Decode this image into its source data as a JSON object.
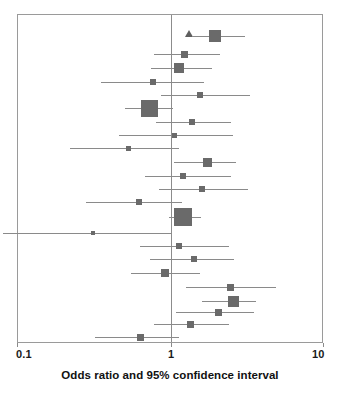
{
  "figure": {
    "type": "forest-plot",
    "axis_title": "Odds ratio and 95% confidence interval",
    "marker_color": "#6a6a6a",
    "line_color": "#8a8a8a",
    "frame_color": "#9a9a9a",
    "null_line_label": "1"
  },
  "axis": {
    "scale": "log10",
    "ticks": [
      {
        "value": 0.1,
        "label": "0.1",
        "x": 17
      },
      {
        "value": 1,
        "label": "1",
        "x": 171
      },
      {
        "value": 10,
        "label": "10",
        "x": 323
      }
    ],
    "min": 0.1,
    "max": 10
  },
  "chart_data": {
    "type": "forest",
    "title": "",
    "subtitle": "",
    "xlabel": "Odds ratio and 95% confidence interval",
    "ylabel": "",
    "xscale": "log",
    "xlim": [
      0.1,
      10
    ],
    "xticks": [
      0.1,
      1,
      10
    ],
    "xticklabels": [
      "0.1",
      "1",
      "10"
    ],
    "grid": false,
    "legend": "none",
    "reference_line": 1,
    "categories": [
      "Study 1",
      "Study 2",
      "Study 3",
      "Study 4",
      "Study 5",
      "Study 6",
      "Study 7",
      "Study 8",
      "Study 9",
      "Study 10",
      "Study 11",
      "Study 12",
      "Study 13",
      "Study 14",
      "Study 15",
      "Study 16",
      "Study 17",
      "Study 18",
      "Study 19"
    ],
    "studies": [
      {
        "label": "Study 1",
        "odds_ratio": 1.95,
        "ci_low": 1.4,
        "ci_high": 3.05,
        "weight": 0.78
      },
      {
        "label": "Study 2",
        "odds_ratio": 1.22,
        "ci_low": 0.78,
        "ci_high": 2.1,
        "weight": 0.4
      },
      {
        "label": "Study 3",
        "odds_ratio": 1.13,
        "ci_low": 0.74,
        "ci_high": 1.85,
        "weight": 0.62
      },
      {
        "label": "Study 4",
        "odds_ratio": 0.76,
        "ci_low": 0.35,
        "ci_high": 1.65,
        "weight": 0.33
      },
      {
        "label": "Study 5",
        "odds_ratio": 1.55,
        "ci_low": 0.86,
        "ci_high": 3.3,
        "weight": 0.33
      },
      {
        "label": "Study 6",
        "odds_ratio": 0.72,
        "ci_low": 0.5,
        "ci_high": 1.03,
        "weight": 1.0
      },
      {
        "label": "Study 7",
        "odds_ratio": 1.38,
        "ci_low": 0.8,
        "ci_high": 2.45,
        "weight": 0.33
      },
      {
        "label": "Study 8",
        "odds_ratio": 1.05,
        "ci_low": 0.46,
        "ci_high": 2.55,
        "weight": 0.26
      },
      {
        "label": "Study 9",
        "odds_ratio": 0.53,
        "ci_low": 0.22,
        "ci_high": 1.12,
        "weight": 0.26
      },
      {
        "label": "Study 10",
        "odds_ratio": 1.72,
        "ci_low": 1.05,
        "ci_high": 2.65,
        "weight": 0.58
      },
      {
        "label": "Study 11",
        "odds_ratio": 1.2,
        "ci_low": 0.68,
        "ci_high": 2.45,
        "weight": 0.33
      },
      {
        "label": "Study 12",
        "odds_ratio": 1.6,
        "ci_low": 0.84,
        "ci_high": 3.2,
        "weight": 0.33
      },
      {
        "label": "Study 13",
        "odds_ratio": 0.62,
        "ci_low": 0.28,
        "ci_high": 1.18,
        "weight": 0.33
      },
      {
        "label": "Study 14",
        "odds_ratio": 1.2,
        "ci_low": 0.97,
        "ci_high": 1.58,
        "weight": 1.05
      },
      {
        "label": "Study 15",
        "odds_ratio": 0.31,
        "ci_low": 0.08,
        "ci_high": 1.0,
        "weight": 0.2
      },
      {
        "label": "Study 16",
        "odds_ratio": 1.13,
        "ci_low": 0.63,
        "ci_high": 2.4,
        "weight": 0.33
      },
      {
        "label": "Study 17",
        "odds_ratio": 1.42,
        "ci_low": 0.73,
        "ci_high": 2.6,
        "weight": 0.33
      },
      {
        "label": "Study 18",
        "odds_ratio": 0.92,
        "ci_low": 0.55,
        "ci_high": 1.55,
        "weight": 0.46
      },
      {
        "label": "Study 19",
        "odds_ratio": 2.45,
        "ci_low": 1.25,
        "ci_high": 4.85,
        "weight": 0.4
      },
      {
        "label": "Study 20",
        "odds_ratio": 2.55,
        "ci_low": 1.6,
        "ci_high": 3.6,
        "weight": 0.72
      },
      {
        "label": "Study 21",
        "odds_ratio": 2.05,
        "ci_low": 1.08,
        "ci_high": 3.5,
        "weight": 0.4
      },
      {
        "label": "Study 22",
        "odds_ratio": 1.35,
        "ci_low": 0.78,
        "ci_high": 2.4,
        "weight": 0.4
      },
      {
        "label": "Study 23",
        "odds_ratio": 0.63,
        "ci_low": 0.32,
        "ci_high": 1.12,
        "weight": 0.4
      }
    ],
    "rows_layout": [
      {
        "y": 35,
        "or": 1.95,
        "lo": 1.4,
        "hi": 3.05,
        "size": 12
      },
      {
        "y": 53,
        "or": 1.22,
        "lo": 0.78,
        "hi": 2.1,
        "size": 7
      },
      {
        "y": 67,
        "or": 1.13,
        "lo": 0.74,
        "hi": 1.85,
        "size": 10
      },
      {
        "y": 81,
        "or": 0.76,
        "lo": 0.35,
        "hi": 1.65,
        "size": 6
      },
      {
        "y": 94,
        "or": 1.55,
        "lo": 0.86,
        "hi": 3.3,
        "size": 6
      },
      {
        "y": 107,
        "or": 0.72,
        "lo": 0.5,
        "hi": 1.03,
        "size": 17
      },
      {
        "y": 121,
        "or": 1.38,
        "lo": 0.8,
        "hi": 2.45,
        "size": 6
      },
      {
        "y": 134,
        "or": 1.05,
        "lo": 0.46,
        "hi": 2.55,
        "size": 5
      },
      {
        "y": 147,
        "or": 0.53,
        "lo": 0.22,
        "hi": 1.12,
        "size": 5
      },
      {
        "y": 161,
        "or": 1.72,
        "lo": 1.05,
        "hi": 2.65,
        "size": 9
      },
      {
        "y": 175,
        "or": 1.2,
        "lo": 0.68,
        "hi": 2.45,
        "size": 6
      },
      {
        "y": 188,
        "or": 1.6,
        "lo": 0.84,
        "hi": 3.2,
        "size": 6
      },
      {
        "y": 201,
        "or": 0.62,
        "lo": 0.28,
        "hi": 1.18,
        "size": 6
      },
      {
        "y": 216,
        "or": 1.2,
        "lo": 0.97,
        "hi": 1.58,
        "size": 18
      },
      {
        "y": 232,
        "or": 0.31,
        "lo": 0.08,
        "hi": 1.0,
        "size": 4
      },
      {
        "y": 245,
        "or": 1.13,
        "lo": 0.63,
        "hi": 2.4,
        "size": 6
      },
      {
        "y": 258,
        "or": 1.42,
        "lo": 0.73,
        "hi": 2.6,
        "size": 6
      },
      {
        "y": 272,
        "or": 0.92,
        "lo": 0.55,
        "hi": 1.55,
        "size": 8
      },
      {
        "y": 286,
        "or": 2.45,
        "lo": 1.25,
        "hi": 4.85,
        "size": 7
      },
      {
        "y": 300,
        "or": 2.55,
        "lo": 1.6,
        "hi": 3.6,
        "size": 11
      },
      {
        "y": 311,
        "or": 2.05,
        "lo": 1.08,
        "hi": 3.5,
        "size": 7
      },
      {
        "y": 323,
        "or": 1.35,
        "lo": 0.78,
        "hi": 2.4,
        "size": 7
      },
      {
        "y": 336,
        "or": 0.63,
        "lo": 0.32,
        "hi": 1.12,
        "size": 7
      }
    ]
  }
}
